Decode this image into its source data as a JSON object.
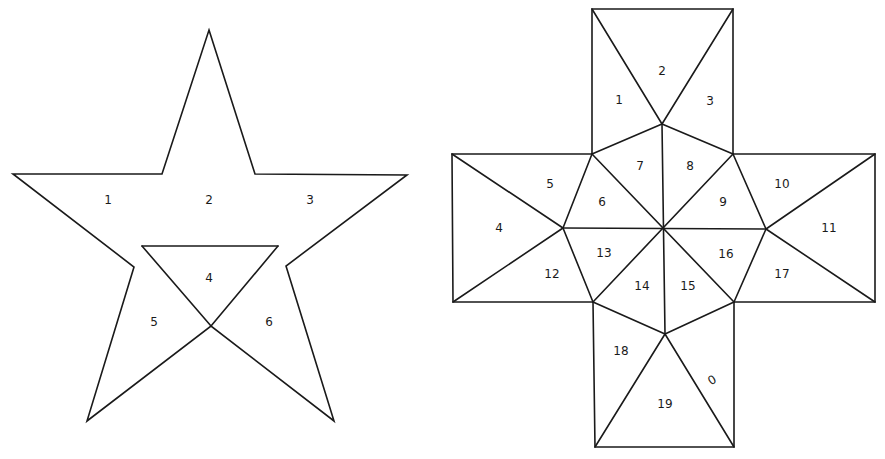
{
  "figures": {
    "star": {
      "name": "pentagram net",
      "outline": [
        [
          209,
          30
        ],
        [
          255,
          174
        ],
        [
          407,
          175
        ],
        [
          286,
          266
        ],
        [
          334,
          421
        ],
        [
          211,
          326
        ],
        [
          87,
          421
        ],
        [
          134,
          267
        ],
        [
          13,
          174
        ],
        [
          162,
          174
        ]
      ],
      "extra_lines": [
        [
          [
            142,
            246
          ],
          [
            278,
            246
          ]
        ],
        [
          [
            142,
            246
          ],
          [
            211,
            326
          ]
        ],
        [
          [
            278,
            246
          ],
          [
            211,
            326
          ]
        ]
      ],
      "labels": [
        {
          "text": "1",
          "x": 108,
          "y": 200
        },
        {
          "text": "2",
          "x": 209,
          "y": 200
        },
        {
          "text": "3",
          "x": 310,
          "y": 200
        },
        {
          "text": "4",
          "x": 209,
          "y": 278
        },
        {
          "text": "5",
          "x": 154,
          "y": 322
        },
        {
          "text": "6",
          "x": 269,
          "y": 322
        }
      ]
    },
    "cross": {
      "name": "cross net",
      "outline": [
        [
          592,
          9
        ],
        [
          733,
          9
        ],
        [
          733,
          154
        ],
        [
          875,
          154
        ],
        [
          875,
          302
        ],
        [
          734,
          302
        ],
        [
          734,
          447
        ],
        [
          595,
          447
        ],
        [
          593,
          302
        ],
        [
          453,
          302
        ],
        [
          452,
          154
        ],
        [
          592,
          154
        ]
      ],
      "extra_lines": [
        [
          [
            592,
            9
          ],
          [
            662,
            124
          ]
        ],
        [
          [
            733,
            9
          ],
          [
            662,
            124
          ]
        ],
        [
          [
            592,
            154
          ],
          [
            662,
            124
          ]
        ],
        [
          [
            733,
            154
          ],
          [
            662,
            124
          ]
        ],
        [
          [
            662,
            124
          ],
          [
            665,
            334
          ]
        ],
        [
          [
            592,
            154
          ],
          [
            563,
            228
          ]
        ],
        [
          [
            563,
            228
          ],
          [
            593,
            302
          ]
        ],
        [
          [
            733,
            154
          ],
          [
            766,
            229
          ]
        ],
        [
          [
            766,
            229
          ],
          [
            734,
            302
          ]
        ],
        [
          [
            593,
            302
          ],
          [
            665,
            334
          ]
        ],
        [
          [
            734,
            302
          ],
          [
            665,
            334
          ]
        ],
        [
          [
            563,
            228
          ],
          [
            766,
            229
          ]
        ],
        [
          [
            592,
            154
          ],
          [
            734,
            302
          ]
        ],
        [
          [
            733,
            154
          ],
          [
            593,
            302
          ]
        ],
        [
          [
            452,
            154
          ],
          [
            563,
            228
          ]
        ],
        [
          [
            453,
            302
          ],
          [
            563,
            228
          ]
        ],
        [
          [
            875,
            154
          ],
          [
            766,
            229
          ]
        ],
        [
          [
            875,
            302
          ],
          [
            766,
            229
          ]
        ],
        [
          [
            665,
            334
          ],
          [
            595,
            447
          ]
        ],
        [
          [
            665,
            334
          ],
          [
            734,
            447
          ]
        ]
      ],
      "labels": [
        {
          "text": "1",
          "x": 619,
          "y": 100
        },
        {
          "text": "2",
          "x": 662,
          "y": 71
        },
        {
          "text": "3",
          "x": 710,
          "y": 101
        },
        {
          "text": "4",
          "x": 499,
          "y": 228
        },
        {
          "text": "5",
          "x": 550,
          "y": 184
        },
        {
          "text": "6",
          "x": 602,
          "y": 202
        },
        {
          "text": "7",
          "x": 640,
          "y": 166
        },
        {
          "text": "8",
          "x": 690,
          "y": 166
        },
        {
          "text": "9",
          "x": 723,
          "y": 202
        },
        {
          "text": "10",
          "x": 782,
          "y": 184
        },
        {
          "text": "11",
          "x": 829,
          "y": 228
        },
        {
          "text": "12",
          "x": 552,
          "y": 274
        },
        {
          "text": "13",
          "x": 604,
          "y": 253
        },
        {
          "text": "14",
          "x": 642,
          "y": 286
        },
        {
          "text": "15",
          "x": 688,
          "y": 286
        },
        {
          "text": "16",
          "x": 726,
          "y": 254
        },
        {
          "text": "17",
          "x": 782,
          "y": 274
        },
        {
          "text": "18",
          "x": 621,
          "y": 351
        },
        {
          "text": "19",
          "x": 665,
          "y": 404
        },
        {
          "text": "0",
          "x": 712,
          "y": 380,
          "rotate": -30
        }
      ]
    }
  }
}
